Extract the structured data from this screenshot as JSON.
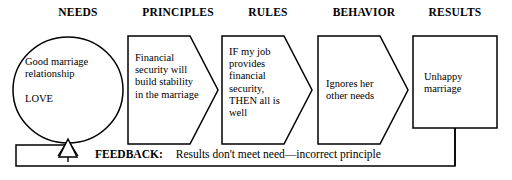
{
  "diagram": {
    "headers": [
      {
        "label": "NEEDS",
        "x": 78
      },
      {
        "label": "PRINCIPLES",
        "x": 178
      },
      {
        "label": "RULES",
        "x": 268
      },
      {
        "label": "BEHAVIOR",
        "x": 364
      },
      {
        "label": "RESULTS",
        "x": 455
      }
    ],
    "nodes": [
      {
        "name": "needs",
        "shape": "ellipse",
        "text": "Good  marriage\nrelationship\n\nLOVE"
      },
      {
        "name": "principles",
        "shape": "chevron",
        "text": "Financial\nsecurity will\nbuild stability\nin the marriage"
      },
      {
        "name": "rules",
        "shape": "chevron",
        "text": "IF my job\nprovides\nfinancial\nsecurity,\nTHEN all is\nwell"
      },
      {
        "name": "behavior",
        "shape": "chevron",
        "text": "Ignores her\nother needs"
      },
      {
        "name": "results",
        "shape": "rectangle",
        "text": "Unhappy\nmarriage"
      }
    ],
    "feedback": {
      "label": "FEEDBACK:",
      "text": "Results don't meet need—incorrect principle"
    },
    "colors": {
      "stroke": "#000000",
      "background": "#ffffff",
      "text": "#000000"
    }
  }
}
